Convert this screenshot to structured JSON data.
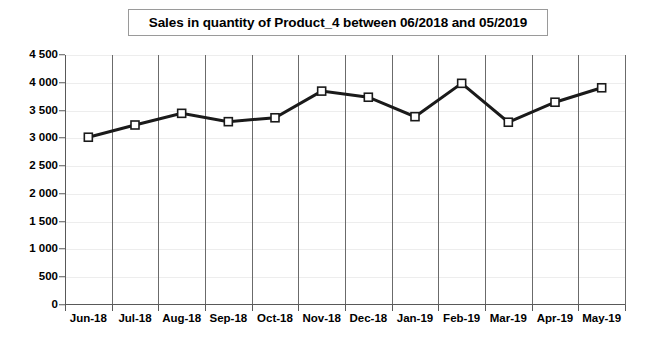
{
  "chart_data": {
    "type": "line",
    "title": "Sales in quantity of Product_4 between 06/2018 and 05/2019",
    "xlabel": "",
    "ylabel": "",
    "categories": [
      "Jun-18",
      "Jul-18",
      "Aug-18",
      "Sep-18",
      "Oct-18",
      "Nov-18",
      "Dec-18",
      "Jan-19",
      "Feb-19",
      "Mar-19",
      "Apr-19",
      "May-19"
    ],
    "values": [
      3020,
      3240,
      3450,
      3300,
      3370,
      3850,
      3740,
      3390,
      3990,
      3290,
      3650,
      3910
    ],
    "series": [
      {
        "name": "Sales in quantity",
        "values": [
          3020,
          3240,
          3450,
          3300,
          3370,
          3850,
          3740,
          3390,
          3990,
          3290,
          3650,
          3910
        ]
      }
    ],
    "ylim": [
      0,
      4500
    ],
    "ytick_values": [
      0,
      500,
      1000,
      1500,
      2000,
      2500,
      3000,
      3500,
      4000,
      4500
    ],
    "ytick_labels": [
      "0",
      "500",
      "1 000",
      "1 500",
      "2 000",
      "2 500",
      "3 000",
      "3 500",
      "4 000",
      "4 500"
    ],
    "grid": "vertical-category-boundaries",
    "legend": "none",
    "marker": "square-open",
    "line_color": "#1a1a1a",
    "marker_fill": "#ffffff",
    "axis_color": "#595959",
    "gridline_color": "#6b6b6b",
    "background": "#ffffff"
  }
}
